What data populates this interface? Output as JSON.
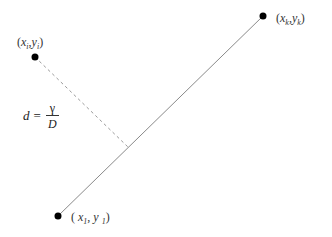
{
  "diagram": {
    "type": "point-to-line-distance",
    "colors": {
      "line": "#8a8a8a",
      "dashed": "#9a9a9a",
      "point": "#000000",
      "text": "#333333"
    },
    "points": [
      {
        "id": "pi",
        "x_label": "x",
        "x_sub": "i",
        "y_label": "y",
        "y_sub": "i",
        "sep": ",",
        "cx": 35,
        "cy": 57
      },
      {
        "id": "pk",
        "x_label": "x",
        "x_sub": "k",
        "y_label": "y",
        "y_sub": "k",
        "sep": ",",
        "cx": 263,
        "cy": 16
      },
      {
        "id": "p1",
        "x_label": "x",
        "x_sub": "1",
        "y_label": "y",
        "y_sub": "1",
        "sep": ",",
        "cx": 58,
        "cy": 216
      }
    ],
    "labels": {
      "open_paren": "(",
      "close_paren": ")"
    },
    "formula": {
      "lhs": "d",
      "eq": "=",
      "numerator": "γ",
      "denominator": "D"
    }
  }
}
